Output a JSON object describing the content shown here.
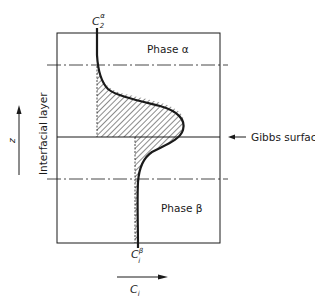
{
  "diagram": {
    "top_label": {
      "main": "C",
      "sub": "2",
      "sup": "α"
    },
    "bottom_label": {
      "main": "C",
      "sub": "i",
      "sup": "β"
    },
    "phase_alpha_label": "Phase α",
    "phase_beta_label": "Phase β",
    "gibbs_surface_label": "Gibbs surface",
    "interfacial_layer_label": "Interfacial layer",
    "z_axis_label": "z",
    "x_axis_label": {
      "main": "C",
      "sub": "i"
    },
    "colors": {
      "ink": "#1a1a1a",
      "background": "#ffffff"
    }
  }
}
